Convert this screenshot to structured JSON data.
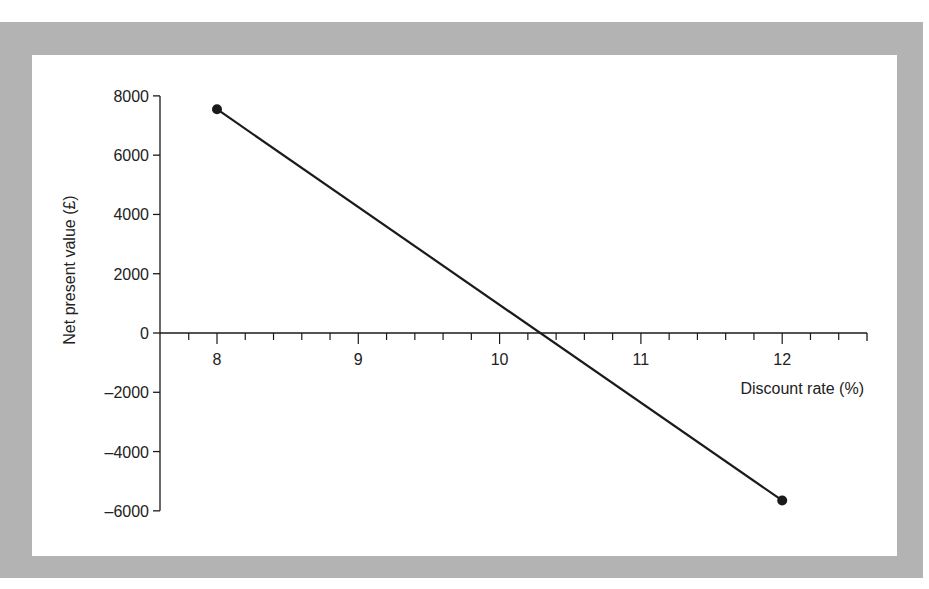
{
  "chart_data": {
    "type": "line",
    "title": "",
    "xlabel": "Discount rate (%)",
    "ylabel": "Net present value (£)",
    "xlim": [
      7.7,
      12.6
    ],
    "ylim": [
      -6000,
      8000
    ],
    "x_ticks": [
      8,
      9,
      10,
      11,
      12
    ],
    "x_minor_step": 0.2,
    "y_ticks": [
      8000,
      6000,
      4000,
      2000,
      0,
      -2000,
      -4000,
      -6000
    ],
    "y_tick_labels": [
      "8000",
      "6000",
      "4000",
      "2000",
      "0",
      "–2000",
      "–4000",
      "–6000"
    ],
    "grid": false,
    "legend": null,
    "series": [
      {
        "name": "NPV",
        "x": [
          8,
          12
        ],
        "y": [
          7550,
          -5650
        ],
        "markers": true,
        "color": "#1a1a1a"
      }
    ],
    "annotations": {
      "zero_crossing_x": 10.29
    }
  },
  "colors": {
    "frame": "#b3b3b3",
    "panel": "#ffffff",
    "ink": "#1a1a1a"
  }
}
